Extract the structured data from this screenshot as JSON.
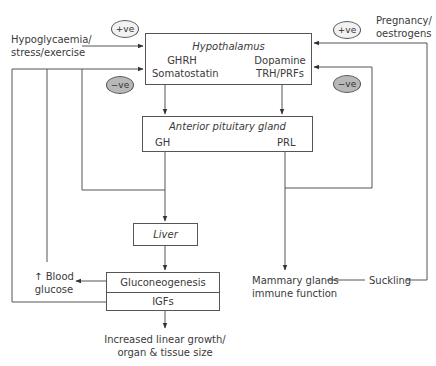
{
  "diagram": {
    "inputs": {
      "left_stimulus": [
        "Hypoglycaemia/",
        "stress/exercise"
      ],
      "right_stimulus": [
        "Pregnancy/",
        "oestrogens"
      ]
    },
    "modifiers": {
      "left_positive": "+ve",
      "left_negative": "−ve",
      "right_positive": "+ve",
      "right_negative": "−ve"
    },
    "hypothalamus": {
      "title": "Hypothalamus",
      "left_hormones": [
        "GHRH",
        "Somatostatin"
      ],
      "right_hormones": [
        "Dopamine",
        "TRH/PRFs"
      ]
    },
    "anterior_pituitary": {
      "title": "Anterior pituitary gland",
      "left_output": "GH",
      "right_output": "PRL"
    },
    "liver": {
      "title": "Liver"
    },
    "liver_outputs": {
      "top": "Gluconeogenesis",
      "bottom": "IGFs"
    },
    "blood_glucose": [
      "↑ Blood",
      "glucose"
    ],
    "growth_outcome": [
      "Increased linear growth/",
      "organ & tissue size"
    ],
    "mammary_outcome": [
      "Mammary glands",
      "immune function"
    ],
    "suckling": "Suckling"
  }
}
